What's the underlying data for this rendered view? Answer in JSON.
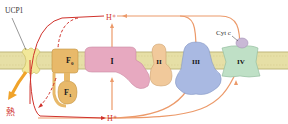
{
  "diagram": {
    "labels": {
      "ucp1": "UCP1",
      "h_plus_top": "H⁺",
      "h_plus_bottom": "H⁺",
      "cyt_c": "Cyt c",
      "heat": "熱",
      "f0": "F",
      "f0_sub": "0",
      "f1": "F",
      "f1_sub": "1",
      "complex_1": "I",
      "complex_2": "II",
      "complex_3": "III",
      "complex_4": "IV"
    },
    "colors": {
      "membrane": "#e6dfa6",
      "membrane_edge": "#b9ae6a",
      "ucp1": "#f2e89a",
      "atp_synthase": "#e8b96a",
      "complex_1": "#e7a9c0",
      "complex_2": "#f1c99b",
      "complex_3": "#a9b9e2",
      "complex_4": "#bfe0c6",
      "cyt_c": "#c9b8d6",
      "proton_path_red": "#d0322c",
      "proton_path_orange": "#ec9a6a",
      "heat_arrow": "#f0a32a",
      "heat_text": "#d0322c"
    }
  }
}
